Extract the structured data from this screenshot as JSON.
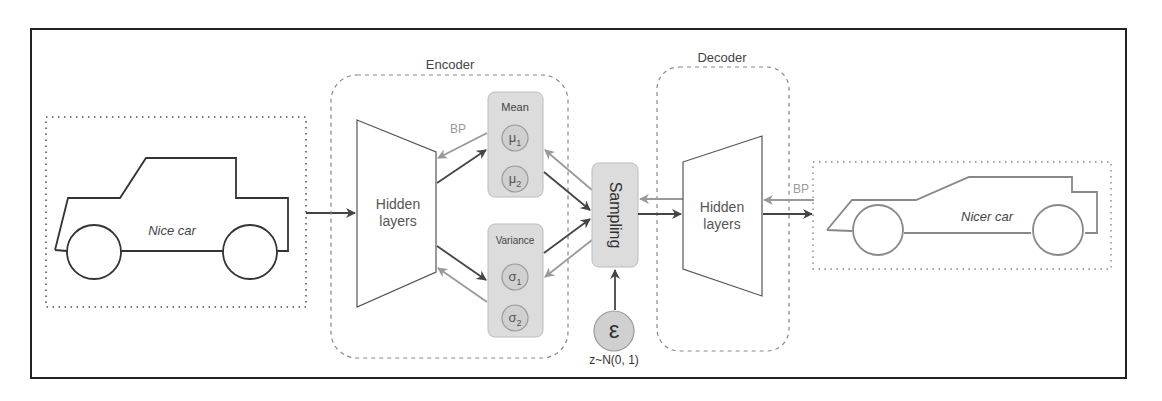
{
  "diagram": {
    "input": {
      "label": "Nice car"
    },
    "output": {
      "label": "Nicer car"
    },
    "encoder": {
      "label": "Encoder",
      "hidden_label_line1": "Hidden",
      "hidden_label_line2": "layers",
      "mean": {
        "label": "Mean",
        "nodes": [
          {
            "symbol": "μ",
            "sub": "1"
          },
          {
            "symbol": "μ",
            "sub": "2"
          }
        ]
      },
      "variance": {
        "label": "Variance",
        "nodes": [
          {
            "symbol": "σ",
            "sub": "1"
          },
          {
            "symbol": "σ",
            "sub": "2"
          }
        ]
      },
      "bp_label": "BP"
    },
    "sampling": {
      "label": "Sampling"
    },
    "epsilon": {
      "symbol": "ε",
      "caption": "z~N(0, 1)"
    },
    "decoder": {
      "label": "Decoder",
      "hidden_label_line1": "Hidden",
      "hidden_label_line2": "layers",
      "bp_label": "BP"
    },
    "colors": {
      "frame": "#222222",
      "forward_arrow": "#444444",
      "backprop_arrow": "#999999",
      "node_fill": "#dcdcdc",
      "dashed": "#888888"
    }
  }
}
